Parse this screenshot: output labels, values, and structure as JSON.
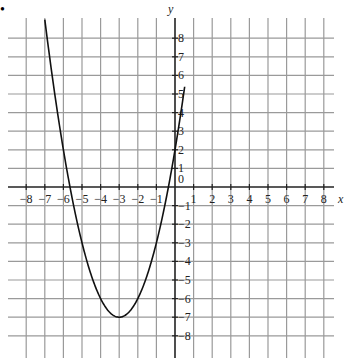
{
  "chart_data": {
    "type": "line",
    "title": "",
    "xlabel": "x",
    "ylabel": "y",
    "xlim": [
      -8.9,
      8.9
    ],
    "ylim": [
      -9,
      9
    ],
    "grid": true,
    "x_ticks": [
      -8,
      -7,
      -6,
      -5,
      -4,
      -3,
      -2,
      -1,
      1,
      2,
      3,
      4,
      5,
      6,
      7,
      8
    ],
    "y_ticks": [
      8,
      7,
      6,
      5,
      4,
      3,
      2,
      1,
      -1,
      -2,
      -3,
      -4,
      -5,
      -6,
      -7,
      -8
    ],
    "origin_label": "0",
    "series": [
      {
        "name": "y = (x+3)^2 - 7",
        "function": "(x+3)^2 - 7",
        "vertex": [
          -3,
          -7
        ],
        "x_range": [
          -7,
          0.52
        ],
        "x": [
          -7,
          -6,
          -5,
          -4,
          -3,
          -2,
          -1,
          0
        ],
        "values": [
          9,
          2,
          -3,
          -6,
          -7,
          -6,
          -3,
          2
        ]
      }
    ]
  },
  "bullet": "•"
}
